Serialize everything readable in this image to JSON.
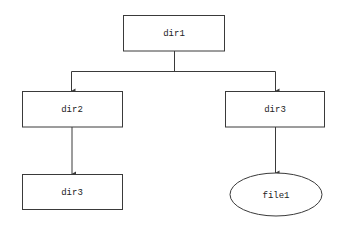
{
  "diagram": {
    "type": "tree",
    "colors": {
      "stroke": "#3a3a3a",
      "text": "#222222",
      "background": "#ffffff"
    },
    "nodes": [
      {
        "id": "dir1",
        "label": "dir1",
        "shape": "rect"
      },
      {
        "id": "dir2",
        "label": "dir2",
        "shape": "rect"
      },
      {
        "id": "dir3_right",
        "label": "dir3",
        "shape": "rect"
      },
      {
        "id": "dir3_left",
        "label": "dir3",
        "shape": "rect"
      },
      {
        "id": "file1",
        "label": "file1",
        "shape": "ellipse"
      }
    ],
    "edges": [
      {
        "from": "dir1",
        "to": "dir2"
      },
      {
        "from": "dir1",
        "to": "dir3_right"
      },
      {
        "from": "dir2",
        "to": "dir3_left"
      },
      {
        "from": "dir3_right",
        "to": "file1"
      }
    ]
  }
}
